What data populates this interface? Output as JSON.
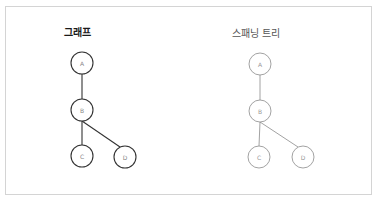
{
  "panels": {
    "left": {
      "title": "그래프",
      "stroke_color": "#333333",
      "label_color": "#888888",
      "nodes": [
        {
          "id": "A",
          "label": "A",
          "cx": 82,
          "cy": 63
        },
        {
          "id": "B",
          "label": "B",
          "cx": 82,
          "cy": 110
        },
        {
          "id": "C",
          "label": "C",
          "cx": 82,
          "cy": 156
        },
        {
          "id": "D",
          "label": "D",
          "cx": 125,
          "cy": 157
        }
      ],
      "edges": [
        {
          "from": "A",
          "to": "B"
        },
        {
          "from": "B",
          "to": "C"
        },
        {
          "from": "B",
          "to": "D"
        }
      ]
    },
    "right": {
      "title": "스패닝 트리",
      "stroke_color": "#8a8a8a",
      "label_color": "#999999",
      "nodes": [
        {
          "id": "A",
          "label": "A",
          "cx": 260,
          "cy": 64
        },
        {
          "id": "B",
          "label": "B",
          "cx": 260,
          "cy": 111
        },
        {
          "id": "C",
          "label": "C",
          "cx": 259,
          "cy": 157
        },
        {
          "id": "D",
          "label": "D",
          "cx": 303,
          "cy": 157
        }
      ],
      "edges": [
        {
          "from": "A",
          "to": "B"
        },
        {
          "from": "B",
          "to": "C"
        },
        {
          "from": "B",
          "to": "D"
        }
      ]
    }
  }
}
